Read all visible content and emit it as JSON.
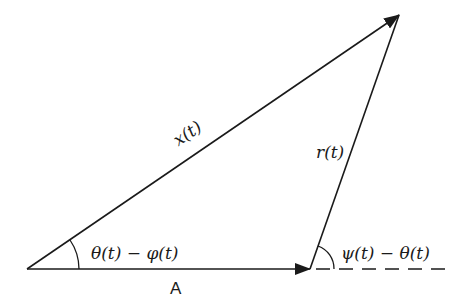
{
  "diagram": {
    "type": "vector-triangle",
    "stroke_color": "#1a1a1a",
    "background": "#ffffff",
    "points": {
      "origin": [
        27,
        269
      ],
      "base_end": [
        310,
        269
      ],
      "apex": [
        399,
        15
      ],
      "dashed_end": [
        445,
        269
      ]
    },
    "vectors": [
      {
        "id": "A",
        "from": "origin",
        "to": "base_end",
        "label": "A",
        "style": "solid-arrow"
      },
      {
        "id": "x",
        "from": "origin",
        "to": "apex",
        "label": "x(t)",
        "style": "solid-arrow"
      },
      {
        "id": "r",
        "from": "base_end",
        "to": "apex",
        "label": "r(t)",
        "style": "solid-arrow"
      },
      {
        "id": "ref",
        "from": "base_end",
        "to": "dashed_end",
        "label": "",
        "style": "dashed"
      }
    ],
    "angles": [
      {
        "vertex": "origin",
        "label": "θ(t) − φ(t)"
      },
      {
        "vertex": "base_end",
        "label": "ψ(t) − θ(t)"
      }
    ]
  },
  "labels": {
    "x": "x(t)",
    "r": "r(t)",
    "A": "A",
    "angle_origin": "θ(t) − φ(t)",
    "angle_base": "ψ(t) − θ(t)"
  }
}
